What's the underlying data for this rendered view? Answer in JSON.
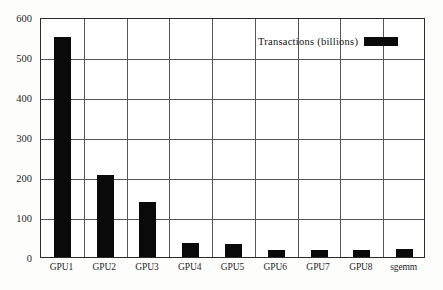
{
  "chart_data": {
    "type": "bar",
    "title": "",
    "xlabel": "",
    "ylabel": "",
    "categories": [
      "GPU1",
      "GPU2",
      "GPU3",
      "GPU4",
      "GPU5",
      "GPU6",
      "GPU7",
      "GPU8",
      "sgemm"
    ],
    "values": [
      550,
      205,
      137,
      34,
      33,
      17,
      17,
      17,
      19
    ],
    "series": [
      {
        "name": "Transactions (billions)",
        "values": [
          550,
          205,
          137,
          34,
          33,
          17,
          17,
          17,
          19
        ],
        "color": "#0a0a0a"
      }
    ],
    "ylim": [
      0,
      600
    ],
    "yticks": [
      0,
      100,
      200,
      300,
      400,
      500,
      600
    ],
    "ytick_labels": [
      "0",
      "100",
      "200",
      "300",
      "400",
      "500",
      "600"
    ],
    "grid": true,
    "grid_color": "#55555a",
    "legend": {
      "position": "top-right",
      "entries": [
        {
          "label": "Transactions (billions)",
          "color": "#0a0a0a"
        }
      ]
    },
    "frame_color": "#2b2b2b",
    "background": "#ffffff"
  },
  "legend": {
    "label": "Transactions (billions)",
    "swatch_color": "#0a0a0a"
  }
}
